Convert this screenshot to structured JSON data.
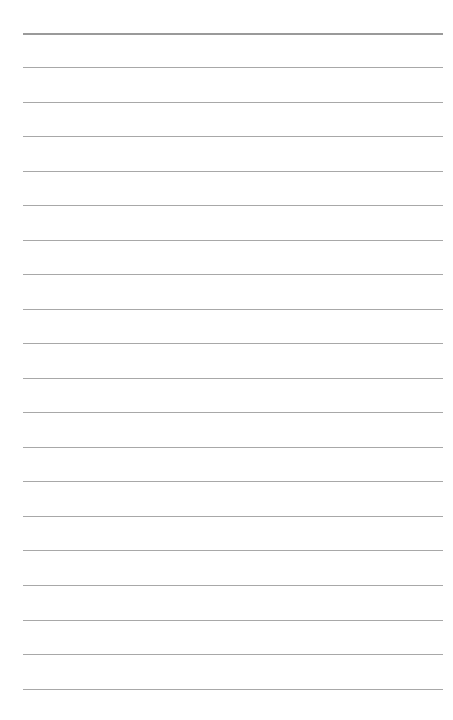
{
  "page": {
    "type": "lined-paper",
    "background_color": "#ffffff",
    "line_color": "#a8a8a8",
    "header_line_color": "#9a9a9a",
    "line_count": 20,
    "first_line_y": 33,
    "line_spacing": 34.5,
    "margin_left": 23,
    "margin_right": 10,
    "lines": [
      {
        "index": 1,
        "y": 33,
        "header": true
      },
      {
        "index": 2,
        "y": 67
      },
      {
        "index": 3,
        "y": 102
      },
      {
        "index": 4,
        "y": 136
      },
      {
        "index": 5,
        "y": 171
      },
      {
        "index": 6,
        "y": 205
      },
      {
        "index": 7,
        "y": 240
      },
      {
        "index": 8,
        "y": 274
      },
      {
        "index": 9,
        "y": 309
      },
      {
        "index": 10,
        "y": 343
      },
      {
        "index": 11,
        "y": 378
      },
      {
        "index": 12,
        "y": 412
      },
      {
        "index": 13,
        "y": 447
      },
      {
        "index": 14,
        "y": 481
      },
      {
        "index": 15,
        "y": 516
      },
      {
        "index": 16,
        "y": 550
      },
      {
        "index": 17,
        "y": 585
      },
      {
        "index": 18,
        "y": 620
      },
      {
        "index": 19,
        "y": 654
      },
      {
        "index": 20,
        "y": 689
      }
    ]
  }
}
